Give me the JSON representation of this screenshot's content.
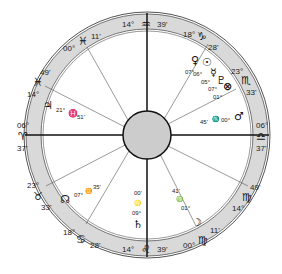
{
  "chart_title": "Natal chart wheel",
  "colors": {
    "ring": "#d9d9d9",
    "center": "#cccccc",
    "line": "#333333"
  },
  "cusps": {
    "mc": {
      "deg": "14°",
      "sign": "♒",
      "min": "39'"
    },
    "ic": {
      "deg": "14°",
      "sign": "♌",
      "min": "39'"
    },
    "asc": {
      "deg": "06°",
      "sign": "♎",
      "min": "37'"
    },
    "dsc": {
      "deg": "06°",
      "sign": "♈",
      "min": "37'"
    },
    "h11": {
      "deg": "18°",
      "sign": "♑",
      "min": "28'"
    },
    "h12": {
      "deg": "23°",
      "sign": "♏",
      "min": "33'"
    },
    "h9": {
      "deg": "00°",
      "sign": "♓",
      "min": "11'"
    },
    "h8": {
      "deg": "14°",
      "sign": "♓",
      "min": "49'"
    },
    "h6": {
      "deg": "23°",
      "sign": "♉",
      "min": "33'"
    },
    "h5": {
      "deg": "18°",
      "sign": "♋",
      "min": "28'"
    },
    "h3": {
      "deg": "00°",
      "sign": "♍",
      "min": "11'"
    },
    "h2": {
      "deg": "14°",
      "sign": "♍",
      "min": "49'"
    }
  },
  "planets": {
    "jupiter": {
      "glyph": "♃",
      "deg": "21°",
      "sign": "♓",
      "min": "51'"
    },
    "mars": {
      "glyph": "♂",
      "deg": "00°",
      "sign": "♏",
      "min": "45'"
    },
    "node": {
      "glyph": "☊",
      "deg": "07°",
      "sign": "♊",
      "min": "35'"
    },
    "saturn": {
      "glyph": "♄",
      "deg": "09°",
      "sign": "♌",
      "min": "00'"
    },
    "moon": {
      "glyph": "☽",
      "deg": "01°",
      "sign": "♍",
      "min": "41'"
    },
    "venus": {
      "glyph": "♀",
      "deg": "07°"
    },
    "sun": {
      "glyph": "☉",
      "deg": "06°"
    },
    "mercury": {
      "glyph": "☿",
      "deg": "05°"
    },
    "pluto": {
      "glyph": "♇",
      "deg": "07°"
    },
    "fortune": {
      "glyph": "⊗",
      "deg": "01°"
    }
  }
}
